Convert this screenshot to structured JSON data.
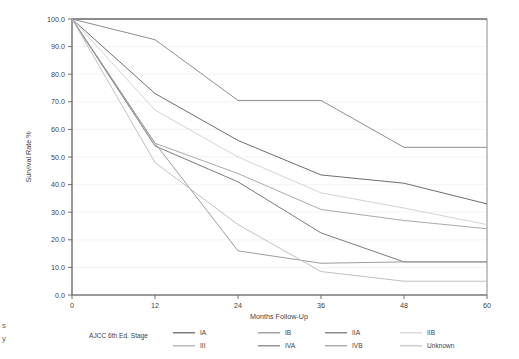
{
  "chart_data": {
    "type": "line",
    "title": "",
    "xlabel": "Months Follow-Up",
    "ylabel": "Survival Rate %",
    "x": [
      0,
      12,
      24,
      36,
      48,
      60
    ],
    "xticklabels": [
      "0",
      "12",
      "24",
      "36",
      "48",
      "60"
    ],
    "xlim": [
      0,
      60
    ],
    "ylim": [
      0,
      100
    ],
    "yticklabels": [
      "0.0",
      "10.0",
      "20.0",
      "30.0",
      "40.0",
      "50.0",
      "60.0",
      "70.0",
      "80.0",
      "90.0",
      "100.0"
    ],
    "yticks": [
      0,
      10,
      20,
      30,
      40,
      50,
      60,
      70,
      80,
      90,
      100
    ],
    "grid": true,
    "legend_position": "bottom",
    "legend_title": "AJCC 6th Ed. Stage",
    "series": [
      {
        "name": "IA",
        "color": "#58595b",
        "values": [
          100,
          100,
          100,
          100,
          100,
          100
        ]
      },
      {
        "name": "IB",
        "color": "#8d8e90",
        "values": [
          100,
          92.5,
          70.5,
          70.5,
          53.5,
          53.5
        ]
      },
      {
        "name": "IIA",
        "color": "#6d6e70",
        "values": [
          100,
          73,
          56,
          43.5,
          40.5,
          33
        ]
      },
      {
        "name": "IIB",
        "color": "#d3d4d5",
        "values": [
          100,
          67,
          50,
          37,
          31.5,
          25.5
        ]
      },
      {
        "name": "III",
        "color": "#a9aaac",
        "values": [
          100,
          55,
          44,
          31,
          27,
          24
        ]
      },
      {
        "name": "IVA",
        "color": "#7a7b7d",
        "values": [
          100,
          54,
          41,
          22.5,
          12,
          12
        ]
      },
      {
        "name": "IVB",
        "color": "#9b9c9e",
        "values": [
          100,
          55,
          16,
          11.5,
          12,
          12
        ]
      },
      {
        "name": "Unknown",
        "color": "#c0c1c2",
        "values": [
          100,
          48,
          25.5,
          8.5,
          5,
          5
        ]
      }
    ]
  },
  "legend": {
    "title": "AJCC 6th Ed. Stage",
    "entries": [
      {
        "label": "IA",
        "color": "#58595b"
      },
      {
        "label": "IB",
        "color": "#8d8e90"
      },
      {
        "label": "IIA",
        "color": "#6d6e70"
      },
      {
        "label": "IIB",
        "color": "#d3d4d5"
      },
      {
        "label": "III",
        "color": "#a9aaac"
      },
      {
        "label": "IVA",
        "color": "#7a7b7d"
      },
      {
        "label": "IVB",
        "color": "#9b9c9e"
      },
      {
        "label": "Unknown",
        "color": "#c0c1c2"
      }
    ]
  },
  "page_edge": {
    "line1": "s",
    "line2": "y"
  },
  "plot_geometry": {
    "left": 72,
    "right": 487,
    "top": 19,
    "bottom": 295
  }
}
